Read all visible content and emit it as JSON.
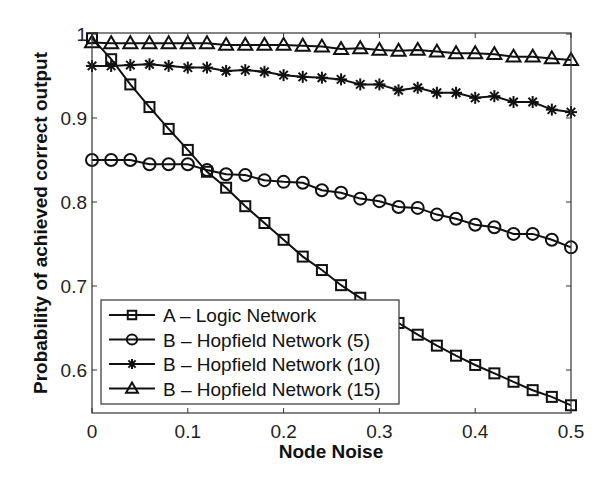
{
  "chart_data": {
    "type": "line",
    "title": "",
    "xlabel": "Node Noise",
    "ylabel": "Probability of achieved correct output",
    "xlim": [
      0,
      0.5
    ],
    "ylim": [
      0.55,
      1.0
    ],
    "grid": false,
    "legend_position": "lower left",
    "xticks": [
      "0",
      "0.1",
      "0.2",
      "0.3",
      "0.4",
      "0.5"
    ],
    "xtick_values": [
      0,
      0.1,
      0.2,
      0.3,
      0.4,
      0.5
    ],
    "yticks": [
      "0.6",
      "0.7",
      "0.8",
      "0.9",
      "1"
    ],
    "ytick_values": [
      0.6,
      0.7,
      0.8,
      0.9,
      1.0
    ],
    "x": [
      0,
      0.02,
      0.04,
      0.06,
      0.08,
      0.1,
      0.12,
      0.14,
      0.16,
      0.18,
      0.2,
      0.22,
      0.24,
      0.26,
      0.28,
      0.3,
      0.32,
      0.34,
      0.36,
      0.38,
      0.4,
      0.42,
      0.44,
      0.46,
      0.48,
      0.5
    ],
    "series": [
      {
        "name": "A – Logic Network",
        "marker": "square",
        "values": [
          0.995,
          0.97,
          0.94,
          0.913,
          0.887,
          0.862,
          0.836,
          0.817,
          0.795,
          0.775,
          0.755,
          0.735,
          0.719,
          0.701,
          0.686,
          0.672,
          0.656,
          0.642,
          0.629,
          0.617,
          0.606,
          0.596,
          0.586,
          0.576,
          0.568,
          0.558
        ]
      },
      {
        "name": "B – Hopfield Network (5)",
        "marker": "circle",
        "values": [
          0.85,
          0.85,
          0.85,
          0.845,
          0.845,
          0.845,
          0.838,
          0.833,
          0.832,
          0.826,
          0.824,
          0.823,
          0.814,
          0.811,
          0.804,
          0.801,
          0.794,
          0.793,
          0.785,
          0.78,
          0.773,
          0.77,
          0.762,
          0.762,
          0.755,
          0.746
        ]
      },
      {
        "name": "B – Hopfield Network (10)",
        "marker": "asterisk",
        "values": [
          0.962,
          0.962,
          0.963,
          0.964,
          0.962,
          0.96,
          0.96,
          0.956,
          0.957,
          0.955,
          0.951,
          0.949,
          0.948,
          0.946,
          0.94,
          0.94,
          0.933,
          0.936,
          0.93,
          0.93,
          0.924,
          0.926,
          0.919,
          0.919,
          0.91,
          0.907
        ]
      },
      {
        "name": "B – Hopfield Network (15)",
        "marker": "triangle",
        "values": [
          0.99,
          0.989,
          0.989,
          0.989,
          0.989,
          0.989,
          0.989,
          0.987,
          0.987,
          0.987,
          0.987,
          0.986,
          0.985,
          0.982,
          0.983,
          0.981,
          0.98,
          0.981,
          0.979,
          0.977,
          0.977,
          0.976,
          0.973,
          0.973,
          0.971,
          0.969
        ]
      }
    ]
  },
  "colors": {
    "line": "#111111",
    "axis": "#333333",
    "background": "#ffffff"
  }
}
